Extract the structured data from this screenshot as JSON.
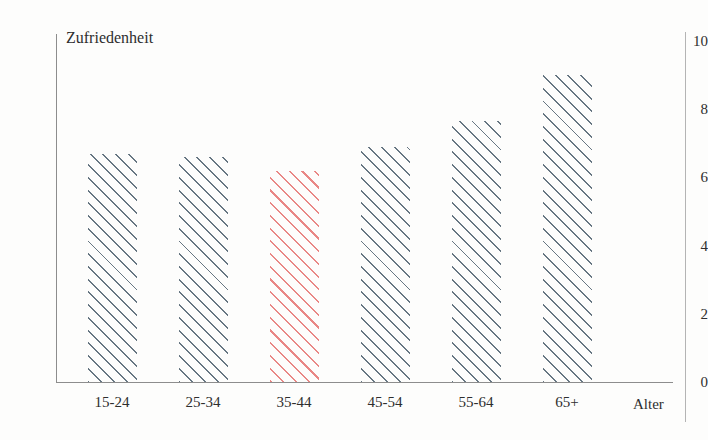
{
  "chart_data": {
    "type": "bar",
    "title": "",
    "xlabel": "Alter",
    "ylabel": "Zufriedenheit",
    "categories": [
      "15-24",
      "25-34",
      "35-44",
      "45-54",
      "55-64",
      "65+"
    ],
    "values": [
      6.7,
      6.6,
      6.2,
      6.9,
      7.65,
      9.0
    ],
    "ylim": [
      0,
      10
    ],
    "yticks": [
      "0",
      "2",
      "4",
      "6",
      "8",
      "10"
    ],
    "ytick_values": [
      0,
      2,
      4,
      6,
      8,
      10
    ],
    "grid": false,
    "legend": "none",
    "highlight_index": 2,
    "colors": {
      "bar_default": "#5a6b78",
      "bar_highlight": "#e8817f",
      "axis": "#8d8d8d",
      "text": "#2e2e2e",
      "background": "#fdfdfc"
    },
    "bar_style": "diagonal-hatch"
  }
}
